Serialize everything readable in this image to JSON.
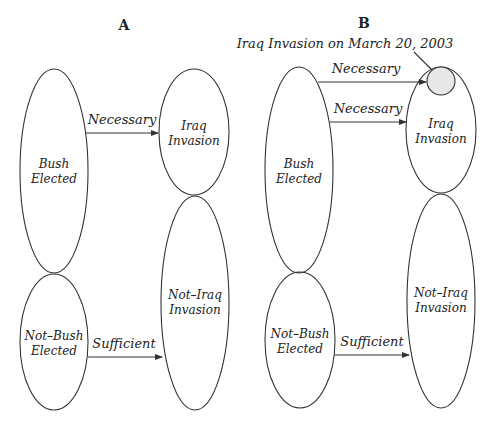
{
  "colors": {
    "stroke": "#333333",
    "text": "#222222",
    "highlight_fill": "#e8e8e8",
    "background": "#ffffff"
  },
  "panels": [
    {
      "title": "A",
      "nodes": {
        "bush_elected": [
          "Bush",
          "Elected"
        ],
        "not_bush_elected": [
          "Not–Bush",
          "Elected"
        ],
        "iraq_invasion": [
          "Iraq",
          "Invasion"
        ],
        "not_iraq_invasion": [
          "Not–Iraq",
          "Invasion"
        ]
      },
      "arrows": [
        {
          "label": "Necessary",
          "from": "Bush Elected",
          "to": "Iraq Invasion"
        },
        {
          "label": "Sufficient",
          "from": "Not–Bush Elected",
          "to": "Not–Iraq Invasion"
        }
      ]
    },
    {
      "title": "B",
      "annotation": "Iraq Invasion on March 20, 2003",
      "nodes": {
        "bush_elected": [
          "Bush",
          "Elected"
        ],
        "not_bush_elected": [
          "Not–Bush",
          "Elected"
        ],
        "iraq_invasion": [
          "Iraq",
          "Invasion"
        ],
        "not_iraq_invasion": [
          "Not–Iraq",
          "Invasion"
        ]
      },
      "arrows": [
        {
          "label": "Necessary",
          "from": "Bush Elected",
          "to": "Iraq Invasion on March 20, 2003"
        },
        {
          "label": "Necessary",
          "from": "Bush Elected",
          "to": "Iraq Invasion"
        },
        {
          "label": "Sufficient",
          "from": "Not–Bush Elected",
          "to": "Not–Iraq Invasion"
        }
      ]
    }
  ]
}
